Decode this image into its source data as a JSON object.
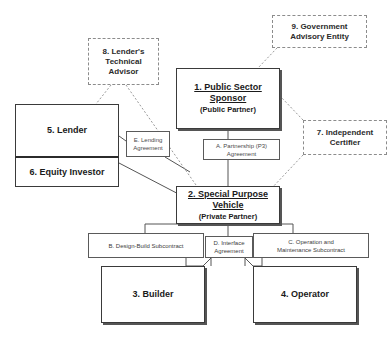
{
  "diagram": {
    "background_color": "#ffffff",
    "solid_border_color": "#3a3a3a",
    "dashed_border_color": "#8c8c8c",
    "line_color": "#555555"
  },
  "entities": {
    "public_sector_sponsor": {
      "name": "1. Public Sector Sponsor",
      "line1": "1. Public Sector",
      "line2": "Sponsor",
      "role": "(Public Partner)"
    },
    "special_purpose_vehicle": {
      "name": "2. Special Purpose Vehicle",
      "line1": "2. Special Purpose",
      "line2": "Vehicle",
      "role": "(Private Partner)"
    },
    "builder": {
      "name": "3. Builder"
    },
    "operator": {
      "name": "4. Operator"
    },
    "lender": {
      "name": "5. Lender"
    },
    "equity_investor": {
      "name": "6. Equity Investor"
    },
    "independent_certifier": {
      "name": "7. Independent Certifier",
      "line1": "7. Independent",
      "line2": "Certifier"
    },
    "lenders_technical_advisor": {
      "name": "8. Lender's Technical Advisor",
      "line1": "8. Lender's",
      "line2": "Technical",
      "line3": "Advisor"
    },
    "government_advisory_entity": {
      "name": "9. Government Advisory Entity",
      "line1": "9. Government",
      "line2": "Advisory Entity"
    }
  },
  "agreements": {
    "partnership": {
      "name": "A. Partnership (P3) Agreement",
      "line1": "A. Partnership (P3)",
      "line2": "Agreement"
    },
    "design_build": {
      "name": "B. Design-Build Subcontract",
      "line1": "B. Design-Build Subcontract"
    },
    "operation_maintenance": {
      "name": "C. Operation and Maintenance Subcontract",
      "line1": "C. Operation and",
      "line2": "Maintenance Subcontract"
    },
    "interface": {
      "name": "D. Interface Agreement",
      "line1": "D. Interface",
      "line2": "Agreement"
    },
    "lending": {
      "name": "E. Lending Agreement",
      "line1": "E. Lending",
      "line2": "Agreement"
    }
  }
}
